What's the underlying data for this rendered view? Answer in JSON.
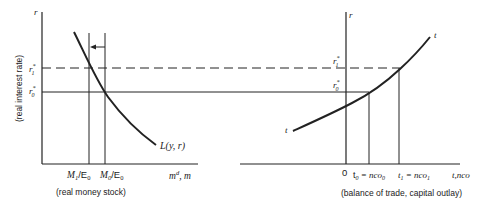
{
  "left_panel": {
    "y_axis_symbol": "r",
    "y_axis_caption": "(real interest rate)",
    "r1_label": "r",
    "r1_sup": "*",
    "r1_sub": "1",
    "r0_label": "r",
    "r0_sup": "*",
    "r0_sub": "0",
    "m1_label": "M",
    "m1_sub": "1",
    "m1_den": "/E",
    "m1_den_sub": "0",
    "m0_label": "M",
    "m0_sub": "0",
    "m0_den": "/E",
    "m0_den_sub": "0",
    "x_axis_symbol": "m",
    "x_axis_sup": "d",
    "x_axis_suffix": ", m",
    "x_axis_caption": "(real money stock)",
    "curve_label": "L(y, r)"
  },
  "right_panel": {
    "y_axis_symbol": "r",
    "r1_label": "r",
    "r1_sup": "*",
    "r1_sub": "1",
    "r0_label": "r",
    "r0_sup": "*",
    "r0_sub": "0",
    "origin_label": "0",
    "t0_label": "t",
    "t0_sub": "0",
    "t0_eq": " = nco",
    "t0_eq_sub": "0",
    "t1_label": "t",
    "t1_sub": "1",
    "t1_eq": " = nco",
    "t1_eq_sub": "1",
    "x_axis_symbol": "t,nco",
    "x_axis_caption": "(balance of trade, capital outlay)",
    "curve_label_start": "t",
    "curve_label_end": "t"
  },
  "colors": {
    "ink": "#222222",
    "background": "#ffffff"
  }
}
